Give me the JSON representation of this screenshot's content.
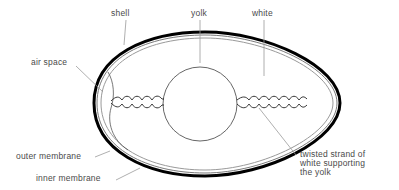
{
  "diagram": {
    "labels": {
      "shell": "shell",
      "yolk": "yolk",
      "white": "white",
      "air_space": "air space",
      "outer_membrane": "outer membrane",
      "inner_membrane": "inner membrane",
      "chalaza": "twisted strand of\nwhite supporting\nthe yolk"
    },
    "colors": {
      "shell_stroke": "#000000",
      "membrane_stroke": "#8a8a8a",
      "line_stroke": "#555555",
      "leader_stroke": "#9a9a9a",
      "label_text": "#4a4a4a",
      "background": "#ffffff"
    }
  }
}
